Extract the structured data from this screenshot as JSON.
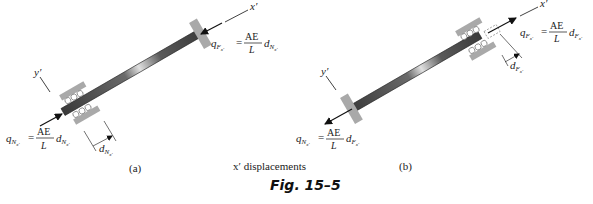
{
  "figure": {
    "caption": "Fig. 15–5",
    "subtitle": "x′ displacements",
    "panels": [
      {
        "id": "a",
        "label": "(a)",
        "axis_x": "x′",
        "axis_y": "y′",
        "far_end_force": {
          "q": "q",
          "q_sub": "F",
          "q_subsub": "x′",
          "eq": "=",
          "num": "AE",
          "den": "L",
          "d": "d",
          "d_sub": "N",
          "d_subsub": "x′"
        },
        "near_end_force": {
          "q": "q",
          "q_sub": "N",
          "q_subsub": "x′",
          "eq": "=",
          "num": "AE",
          "den": "L",
          "d": "d",
          "d_sub": "N",
          "d_subsub": "x′"
        },
        "displacement": {
          "d": "d",
          "d_sub": "N",
          "d_subsub": "x′"
        }
      },
      {
        "id": "b",
        "label": "(b)",
        "axis_x": "x′",
        "axis_y": "y′",
        "far_end_force": {
          "q": "q",
          "q_sub": "F",
          "q_subsub": "x′",
          "eq": "=",
          "num": "AE",
          "den": "L",
          "d": "d",
          "d_sub": "F",
          "d_subsub": "x′"
        },
        "near_end_force": {
          "q": "q",
          "q_sub": "N",
          "q_subsub": "x′",
          "eq": "=",
          "num": "AE",
          "den": "L",
          "d": "d",
          "d_sub": "F",
          "d_subsub": "x′"
        },
        "displacement": {
          "d": "d",
          "d_sub": "F",
          "d_subsub": "x′"
        }
      }
    ]
  },
  "colors": {
    "member_dark": "#3a3a3a",
    "member_light": "#d8d8d8",
    "support_gray": "#a9a9a9",
    "line": "#111111"
  }
}
